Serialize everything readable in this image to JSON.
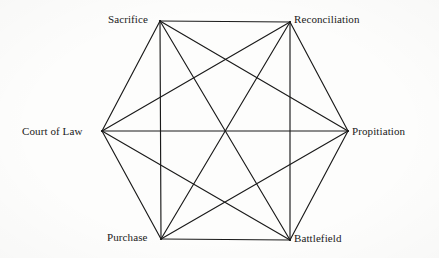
{
  "diagram": {
    "type": "complete-graph-hexagon",
    "shape": "hexagon",
    "vertex_count": 6,
    "edge_count": 15,
    "ink_color": "#1a1a1a",
    "background_color": "#fdfdfc",
    "nodes": [
      {
        "id": "sacrifice",
        "label": "Sacrifice",
        "x": 160,
        "y": 21,
        "label_anchor": "end"
      },
      {
        "id": "reconciliation",
        "label": "Reconciliation",
        "x": 290,
        "y": 22,
        "label_anchor": "start"
      },
      {
        "id": "court_of_law",
        "label": "Court of Law",
        "x": 102,
        "y": 131,
        "label_anchor": "end"
      },
      {
        "id": "propitiation",
        "label": "Propitiation",
        "x": 348,
        "y": 131,
        "label_anchor": "start"
      },
      {
        "id": "purchase",
        "label": "Purchase",
        "x": 161,
        "y": 239,
        "label_anchor": "end"
      },
      {
        "id": "battlefield",
        "label": "Battlefield",
        "x": 290,
        "y": 240,
        "label_anchor": "start"
      }
    ],
    "edges": [
      [
        "sacrifice",
        "reconciliation"
      ],
      [
        "sacrifice",
        "court_of_law"
      ],
      [
        "sacrifice",
        "propitiation"
      ],
      [
        "sacrifice",
        "purchase"
      ],
      [
        "sacrifice",
        "battlefield"
      ],
      [
        "reconciliation",
        "court_of_law"
      ],
      [
        "reconciliation",
        "propitiation"
      ],
      [
        "reconciliation",
        "purchase"
      ],
      [
        "reconciliation",
        "battlefield"
      ],
      [
        "court_of_law",
        "propitiation"
      ],
      [
        "court_of_law",
        "purchase"
      ],
      [
        "court_of_law",
        "battlefield"
      ],
      [
        "propitiation",
        "purchase"
      ],
      [
        "propitiation",
        "battlefield"
      ],
      [
        "purchase",
        "battlefield"
      ]
    ]
  }
}
